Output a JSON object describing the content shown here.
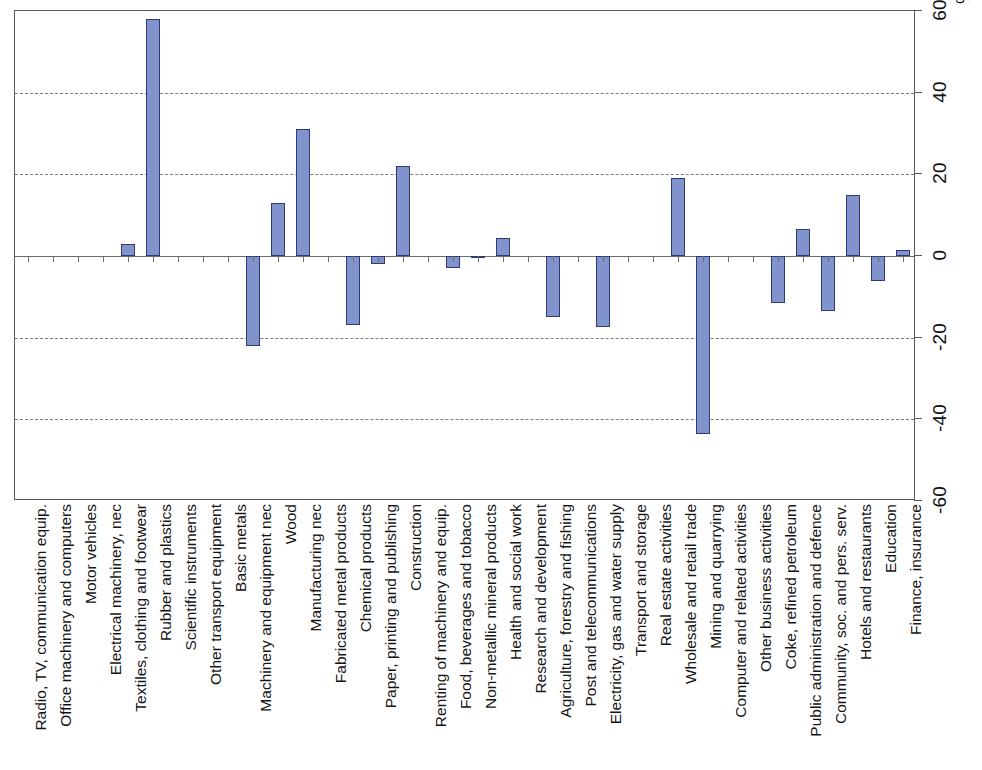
{
  "chart_data": {
    "type": "bar",
    "title": "",
    "subtitle": "",
    "xlabel": "",
    "ylabel": "",
    "unit_label": "%",
    "ylim": [
      -60,
      60
    ],
    "ytick_values": [
      60,
      40,
      20,
      0,
      -20,
      -40,
      -60
    ],
    "ytick_labels": [
      "60",
      "40",
      "20",
      "0",
      "-20",
      "-40",
      "-60"
    ],
    "grid": true,
    "gridlines_at": [
      40,
      20,
      -20,
      -40
    ],
    "zero_line_at": 0,
    "legend": [],
    "orientation": "vertical-bars-rotated-labels",
    "bar_fill_color": "#8193cc",
    "bar_border_color": "#2f3a74",
    "categories": [
      "Radio, TV, communication equip.",
      "Office machinery and computers",
      "Motor vehicles",
      "Electrical machinery, nec",
      "Textiles, clothing and footwear",
      "Rubber and plastics",
      "Scientific instruments",
      "Other transport equipment",
      "Basic metals",
      "Machinery and equipment nec",
      "Wood",
      "Manufacturing nec",
      "Fabricated metal products",
      "Chemical products",
      "Paper, printing and publishing",
      "Construction",
      "Renting of machinery and equip.",
      "Food, beverages and tobacco",
      "Non-metallic mineral products",
      "Health and social work",
      "Research and development",
      "Agriculture, forestry and fishing",
      "Post and telecommunications",
      "Electricity, gas and water supply",
      "Transport and storage",
      "Real estate activities",
      "Wholesale and retail trade",
      "Mining and quarrying",
      "Computer and related activities",
      "Other business activities",
      "Coke, refined petroleum",
      "Public administration and defence",
      "Community, soc. and pers. serv.",
      "Hotels and restaurants",
      "Education",
      "Finance, insurance"
    ],
    "values": [
      0,
      0,
      0,
      0,
      3,
      58,
      0,
      0,
      0,
      -22,
      13,
      31,
      0,
      -17,
      -2,
      22,
      0,
      -3,
      -0.5,
      4.5,
      0,
      -15,
      0,
      -17.5,
      0,
      0,
      19,
      -43.5,
      0,
      0,
      -11.5,
      6.5,
      -13.5,
      15,
      -6,
      1.5
    ]
  }
}
